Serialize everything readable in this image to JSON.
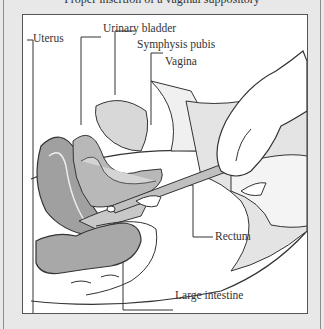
{
  "caption": "Proper insertion of a vaginal suppository",
  "labels": {
    "uterus": "Uterus",
    "urinary_bladder": "Urinary bladder",
    "symphysis_pubis": "Symphysis pubis",
    "vagina": "Vagina",
    "rectum": "Rectum",
    "large_intestine": "Large intestine"
  },
  "colors": {
    "background": "#e8e8e8",
    "panel": "#ffffff",
    "border": "#555555",
    "tissue": "#a0a0a0",
    "tissue_light": "#d0d0d0",
    "line": "#333333"
  }
}
